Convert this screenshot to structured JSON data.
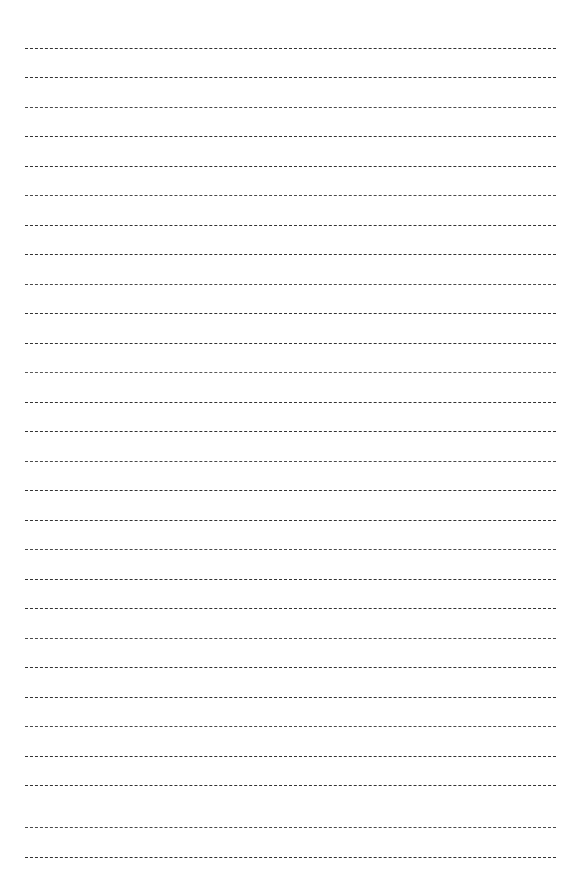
{
  "document": {
    "kind": "lined-writing-paper",
    "title": "",
    "page_width": 580,
    "page_height": 890,
    "background_color": "#ffffff"
  },
  "rules": {
    "count": 28,
    "style": "dashed",
    "color": "#3a3a3a",
    "thickness_px": 1,
    "dash_length_px": 5,
    "dash_gap_px": 2,
    "left_x": 25,
    "right_x": 556,
    "line_length_px": 531,
    "first_line_y": 48,
    "line_spacing_px": 30,
    "lines": [
      {
        "index": 1,
        "y": 48,
        "tone": "tone-a"
      },
      {
        "index": 2,
        "y": 77,
        "tone": "tone-a"
      },
      {
        "index": 3,
        "y": 107,
        "tone": "tone-b"
      },
      {
        "index": 4,
        "y": 136,
        "tone": "tone-a"
      },
      {
        "index": 5,
        "y": 166,
        "tone": "tone-a"
      },
      {
        "index": 6,
        "y": 195,
        "tone": "tone-b"
      },
      {
        "index": 7,
        "y": 225,
        "tone": "tone-a"
      },
      {
        "index": 8,
        "y": 254,
        "tone": "tone-a"
      },
      {
        "index": 9,
        "y": 284,
        "tone": "tone-b"
      },
      {
        "index": 10,
        "y": 313,
        "tone": "tone-a"
      },
      {
        "index": 11,
        "y": 343,
        "tone": "tone-a"
      },
      {
        "index": 12,
        "y": 372,
        "tone": "tone-c"
      },
      {
        "index": 13,
        "y": 402,
        "tone": "tone-a"
      },
      {
        "index": 14,
        "y": 431,
        "tone": "tone-a"
      },
      {
        "index": 15,
        "y": 461,
        "tone": "tone-b"
      },
      {
        "index": 16,
        "y": 490,
        "tone": "tone-a"
      },
      {
        "index": 17,
        "y": 520,
        "tone": "tone-a"
      },
      {
        "index": 18,
        "y": 549,
        "tone": "tone-b"
      },
      {
        "index": 19,
        "y": 579,
        "tone": "tone-a"
      },
      {
        "index": 20,
        "y": 608,
        "tone": "tone-a"
      },
      {
        "index": 21,
        "y": 638,
        "tone": "tone-b"
      },
      {
        "index": 22,
        "y": 667,
        "tone": "tone-a"
      },
      {
        "index": 23,
        "y": 697,
        "tone": "tone-a"
      },
      {
        "index": 24,
        "y": 726,
        "tone": "tone-b"
      },
      {
        "index": 25,
        "y": 756,
        "tone": "tone-a"
      },
      {
        "index": 26,
        "y": 785,
        "tone": "tone-a"
      },
      {
        "index": 27,
        "y": 827,
        "tone": "tone-b"
      },
      {
        "index": 28,
        "y": 857,
        "tone": "tone-a"
      }
    ]
  }
}
